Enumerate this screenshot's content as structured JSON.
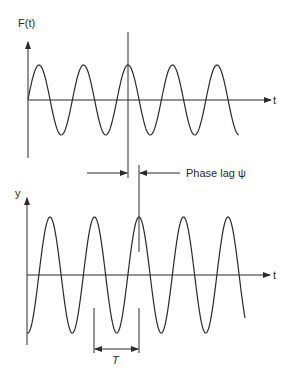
{
  "top_plot": {
    "y_label": "F(t)",
    "x_label": "t",
    "curve": "sinusoid"
  },
  "phase_lag": {
    "label": "Phase lag ψ"
  },
  "bottom_plot": {
    "y_label": "y",
    "x_label": "t",
    "curve": "sinusoid",
    "period_label": "T"
  },
  "colors": {
    "line": "#2a2a2a",
    "background": "#ffffff"
  }
}
